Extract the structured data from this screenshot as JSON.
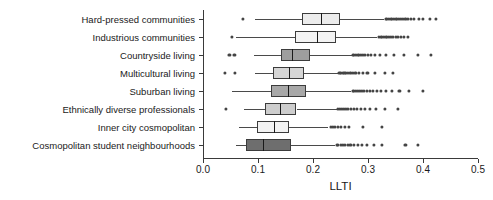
{
  "chart_data": {
    "type": "box",
    "title": "",
    "xlabel": "LLTI",
    "ylabel": "",
    "xlim": [
      0.0,
      0.5
    ],
    "xticks": [
      0.0,
      0.1,
      0.2,
      0.3,
      0.4,
      0.5
    ],
    "xticklabels": [
      "0.0",
      "0.1",
      "0.2",
      "0.3",
      "0.4",
      "0.5"
    ],
    "grid": false,
    "legend": null,
    "orientation": "horizontal",
    "categories": [
      "Hard-pressed communities",
      "Industrious communities",
      "Countryside living",
      "Multicultural living",
      "Suburban living",
      "Ethnically diverse professionals",
      "Inner city cosmopolitan",
      "Cosmopolitan student neighbourhoods"
    ],
    "boxes": [
      {
        "category": "Hard-pressed communities",
        "whisker_low": 0.095,
        "q1": 0.18,
        "median": 0.216,
        "q3": 0.249,
        "whisker_high": 0.33,
        "fill": "#ececec",
        "outliers_low": [
          0.073
        ],
        "outliers_high": [
          0.332,
          0.335,
          0.338,
          0.341,
          0.344,
          0.347,
          0.35,
          0.353,
          0.356,
          0.36,
          0.364,
          0.368,
          0.372,
          0.378,
          0.384,
          0.392,
          0.4,
          0.412,
          0.424
        ]
      },
      {
        "category": "Industrious communities",
        "whisker_low": 0.06,
        "q1": 0.168,
        "median": 0.208,
        "q3": 0.241,
        "whisker_high": 0.317,
        "fill": "#f3f3f3",
        "outliers_low": [
          0.053
        ],
        "outliers_high": [
          0.32,
          0.323,
          0.326,
          0.329,
          0.332,
          0.335,
          0.338,
          0.342,
          0.346,
          0.35,
          0.355,
          0.36,
          0.366,
          0.372
        ]
      },
      {
        "category": "Countryside living",
        "whisker_low": 0.092,
        "q1": 0.141,
        "median": 0.163,
        "q3": 0.195,
        "whisker_high": 0.27,
        "fill": "#9e9e9e",
        "outliers_low": [
          0.048,
          0.057
        ],
        "outliers_high": [
          0.272,
          0.275,
          0.278,
          0.281,
          0.284,
          0.287,
          0.291,
          0.295,
          0.3,
          0.306,
          0.313,
          0.322,
          0.333,
          0.347,
          0.366,
          0.39,
          0.415
        ]
      },
      {
        "category": "Multicultural living",
        "whisker_low": 0.095,
        "q1": 0.128,
        "median": 0.157,
        "q3": 0.183,
        "whisker_high": 0.245,
        "fill": "#d6d6d6",
        "outliers_low": [
          0.04,
          0.058
        ],
        "outliers_high": [
          0.248,
          0.251,
          0.254,
          0.257,
          0.26,
          0.264,
          0.268,
          0.272,
          0.277,
          0.283,
          0.29,
          0.299,
          0.312,
          0.33,
          0.345
        ]
      },
      {
        "category": "Suburban living",
        "whisker_low": 0.052,
        "q1": 0.124,
        "median": 0.156,
        "q3": 0.188,
        "whisker_high": 0.27,
        "fill": "#a8a8a8",
        "outliers_low": [],
        "outliers_high": [
          0.272,
          0.275,
          0.278,
          0.281,
          0.285,
          0.289,
          0.293,
          0.298,
          0.303,
          0.309,
          0.316,
          0.324,
          0.333,
          0.344,
          0.357,
          0.374,
          0.4
        ]
      },
      {
        "category": "Ethnically diverse professionals",
        "whisker_low": 0.075,
        "q1": 0.112,
        "median": 0.141,
        "q3": 0.17,
        "whisker_high": 0.243,
        "fill": "#cdcdcd",
        "outliers_low": [
          0.042
        ],
        "outliers_high": [
          0.246,
          0.249,
          0.252,
          0.256,
          0.26,
          0.264,
          0.269,
          0.274,
          0.28,
          0.287,
          0.295,
          0.304,
          0.315,
          0.33,
          0.354
        ]
      },
      {
        "category": "Inner city cosmopolitan",
        "whisker_low": 0.065,
        "q1": 0.098,
        "median": 0.13,
        "q3": 0.157,
        "whisker_high": 0.228,
        "fill": "#f2f2f2",
        "outliers_low": [],
        "outliers_high": [
          0.232,
          0.236,
          0.24,
          0.245,
          0.251,
          0.258,
          0.266,
          0.29,
          0.326
        ]
      },
      {
        "category": "Cosmopolitan student neighbourhoods",
        "whisker_low": 0.06,
        "q1": 0.078,
        "median": 0.11,
        "q3": 0.16,
        "whisker_high": 0.24,
        "fill": "#6e6e6e",
        "outliers_low": [],
        "outliers_high": [
          0.243,
          0.246,
          0.25,
          0.254,
          0.258,
          0.263,
          0.268,
          0.274,
          0.281,
          0.289,
          0.298,
          0.31,
          0.325,
          0.368,
          0.39
        ]
      }
    ]
  },
  "axis": {
    "x_title": "LLTI"
  }
}
